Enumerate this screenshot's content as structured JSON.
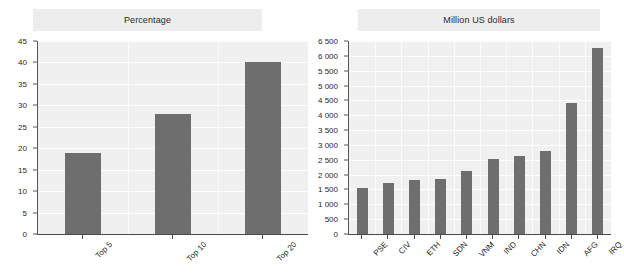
{
  "figure": {
    "background_color": "#ffffff",
    "bar_color": "#6e6e6e",
    "plot_background_color": "#f0f0f0",
    "title_band_color": "#ededed",
    "gridline_color": "#ffffff",
    "axis_color": "#4a4a4a"
  },
  "chart_data": [
    {
      "type": "bar",
      "title": "Percentage",
      "xlabel": "",
      "ylabel": "",
      "categories": [
        "Top 5",
        "Top 10",
        "Top 20"
      ],
      "values": [
        19,
        28,
        40
      ],
      "ylim": [
        0,
        45
      ],
      "yticks": [
        0,
        5,
        10,
        15,
        20,
        25,
        30,
        35,
        40,
        45
      ],
      "ytick_labels": [
        "0",
        "5",
        "10",
        "15",
        "20",
        "25",
        "30",
        "35",
        "40",
        "45"
      ],
      "grid": true,
      "legend": "none",
      "xtick_label_rotation": -45
    },
    {
      "type": "bar",
      "title": "Million US dollars",
      "xlabel": "",
      "ylabel": "",
      "categories": [
        "PSE",
        "CIV",
        "ETH",
        "SDN",
        "VNM",
        "IND",
        "CHN",
        "IDN",
        "AFG",
        "IRQ"
      ],
      "values": [
        1540,
        1720,
        1820,
        1860,
        2110,
        2530,
        2620,
        2800,
        4400,
        6250
      ],
      "ylim": [
        0,
        6500
      ],
      "yticks": [
        0,
        500,
        1000,
        1500,
        2000,
        2500,
        3000,
        3500,
        4000,
        4500,
        5000,
        5500,
        6000,
        6500
      ],
      "ytick_labels": [
        "0",
        "500",
        "1 000",
        "1 500",
        "2 000",
        "2 500",
        "3 000",
        "3 500",
        "4 000",
        "4 500",
        "5 000",
        "5 500",
        "6 000",
        "6 500"
      ],
      "grid": true,
      "legend": "none",
      "xtick_label_rotation": -45
    }
  ]
}
